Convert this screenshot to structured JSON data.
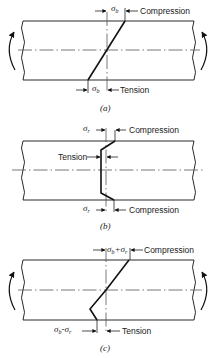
{
  "figure": {
    "panels": [
      {
        "id": "a",
        "caption": "(a)",
        "top_label": {
          "symbol": "σ",
          "sub": "b",
          "text": "Compression"
        },
        "bottom_label": {
          "symbol": "σ",
          "sub": "b",
          "text": "Tension"
        },
        "moment_arrows": true,
        "distribution": "linear bending stress"
      },
      {
        "id": "b",
        "caption": "(b)",
        "top_label": {
          "symbol": "σ",
          "sub": "r",
          "text": "Compression"
        },
        "middle_label": {
          "text": "Tension"
        },
        "bottom_label": {
          "symbol": "σ",
          "sub": "r",
          "text": "Compression"
        },
        "moment_arrows": false,
        "distribution": "residual stress"
      },
      {
        "id": "c",
        "caption": "(c)",
        "top_label": {
          "symbol": "σ",
          "sub": "b",
          "op": "+",
          "symbol2": "σ",
          "sub2": "r",
          "text": "Compression"
        },
        "bottom_label": {
          "symbol": "σ",
          "sub": "b",
          "op": "-",
          "symbol2": "σ",
          "sub2": "r",
          "text": "Tension"
        },
        "moment_arrows": true,
        "distribution": "combined bending + residual stress"
      }
    ]
  }
}
